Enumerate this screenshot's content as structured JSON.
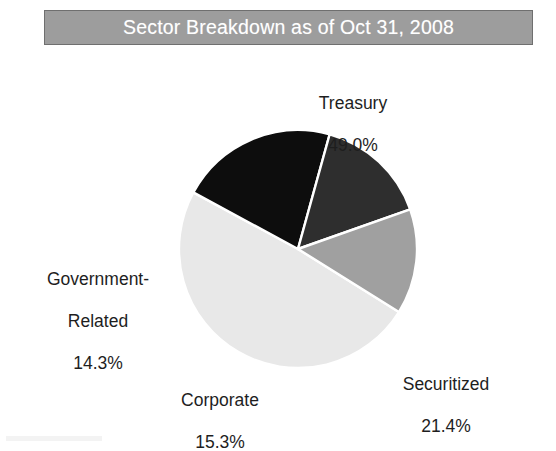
{
  "title": {
    "text": "Sector Breakdown as of Oct 31, 2008",
    "banner_color": "#9d9d9d",
    "text_color": "#ffffff"
  },
  "chart_data": {
    "type": "pie",
    "title": "Sector Breakdown as of Oct 31, 2008",
    "xlabel": "",
    "ylabel": "",
    "grid": false,
    "legend": "none",
    "value_unit": "%",
    "labels": [
      "Treasury",
      "Securitized",
      "Corporate",
      "Government-Related"
    ],
    "values": [
      49.0,
      21.4,
      15.3,
      14.3
    ],
    "value_labels": [
      "49.0%",
      "21.4%",
      "15.3%",
      "14.3%"
    ],
    "colors": [
      "#e8e8e8",
      "#0d0d0d",
      "#2e2e2e",
      "#a0a0a0"
    ],
    "slice_edge_color": "#ffffff",
    "start_angle_deg": 32,
    "direction": "clockwise",
    "slices": [
      {
        "name": "Treasury",
        "value": 49.0,
        "value_label": "49.0%",
        "color": "#e8e8e8",
        "label_line1": "Treasury",
        "label_line2": "49.0%"
      },
      {
        "name": "Securitized",
        "value": 21.4,
        "value_label": "21.4%",
        "color": "#0d0d0d",
        "label_line1": "Securitized",
        "label_line2": "21.4%"
      },
      {
        "name": "Corporate",
        "value": 15.3,
        "value_label": "15.3%",
        "color": "#2e2e2e",
        "label_line1": "Corporate",
        "label_line2": "15.3%"
      },
      {
        "name": "Government-Related",
        "value": 14.3,
        "value_label": "14.3%",
        "color": "#a0a0a0",
        "label_line1": "Government-",
        "label_line2": "Related",
        "label_line3": "14.3%"
      }
    ]
  }
}
